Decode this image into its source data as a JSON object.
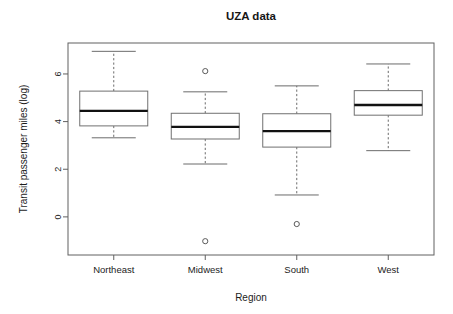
{
  "chart_data": {
    "type": "box",
    "title": "UZA data",
    "xlabel": "Region",
    "ylabel": "Transit passenger miles (log)",
    "categories": [
      "Northeast",
      "Midwest",
      "South",
      "West"
    ],
    "ytick_labels": [
      "0",
      "2",
      "4",
      "6"
    ],
    "ytick_values": [
      0,
      2,
      4,
      6
    ],
    "ylim": [
      -1.6,
      7.3
    ],
    "grid": false,
    "legend": "none",
    "boxes": [
      {
        "category": "Northeast",
        "whisker_low": 3.32,
        "q1": 3.82,
        "median": 4.45,
        "q3": 5.28,
        "whisker_high": 6.95,
        "outliers": []
      },
      {
        "category": "Midwest",
        "whisker_low": 2.22,
        "q1": 3.27,
        "median": 3.78,
        "q3": 4.35,
        "whisker_high": 5.25,
        "outliers": [
          6.12,
          -1.02
        ]
      },
      {
        "category": "South",
        "whisker_low": 0.92,
        "q1": 2.93,
        "median": 3.6,
        "q3": 4.33,
        "whisker_high": 5.5,
        "outliers": [
          -0.3
        ]
      },
      {
        "category": "West",
        "whisker_low": 2.78,
        "q1": 4.27,
        "median": 4.7,
        "q3": 5.3,
        "whisker_high": 6.42,
        "outliers": []
      }
    ]
  },
  "plot_geometry": {
    "frame_left": 68,
    "frame_right": 434,
    "frame_top": 43,
    "frame_bottom": 255,
    "box_half_width": 34,
    "cap_half_width": 22,
    "outlier_radius": 2.6
  },
  "colors": {
    "background": "#ffffff",
    "frame": "#606060",
    "box_stroke": "#707070",
    "median": "#111111",
    "whisker": "#6b6b6b",
    "text": "#1c1c1c"
  }
}
